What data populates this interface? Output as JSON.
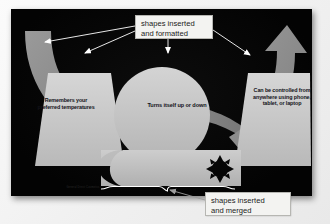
{
  "slide": {
    "background_color": "#050505",
    "shape_fill": "#c9c9c9",
    "shape_fill_dark": "#8e8e8e",
    "shape_text_color": "#13131a",
    "left_shape": {
      "name": "left-trapezoid",
      "text": "Remembers your preferred temperatures"
    },
    "center_shape": {
      "name": "center-circle",
      "text": "Turns itself up or down"
    },
    "right_shape": {
      "name": "right-trapezoid",
      "text": "Can be controlled from anywhere using phone, tablet, or laptop"
    },
    "banner": {
      "name": "bottom-banner",
      "line1": "A Smart Thermostat",
      "line2": "Works Night and Day",
      "moon_icon": "crescent-moon-icon",
      "sun_icon": "sun-icon"
    },
    "credit_text": "General Direct Cosmetics"
  },
  "annotations": {
    "top_callout": {
      "line1": "shapes inserted",
      "line2": "and formatted",
      "background": "#f3f3f1",
      "border": "#b6b6b2"
    },
    "bottom_callout": {
      "line1": "shapes inserted",
      "line2": "and merged",
      "background": "#f3f3f1",
      "border": "#b6b6b2"
    },
    "arrow_color": "#ffffff",
    "brace_label": "curly-brace"
  }
}
